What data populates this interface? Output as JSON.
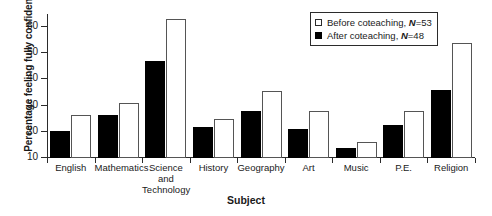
{
  "chart_data": {
    "type": "bar",
    "title": "",
    "xlabel": "Subject",
    "ylabel": "Percentage feeling fully confident",
    "ylim": [
      10,
      65
    ],
    "yticks": [
      10,
      20,
      30,
      40,
      50,
      60
    ],
    "grid": false,
    "legend_position": "top-right",
    "categories": [
      "English",
      "Mathematics",
      "Science\nand\nTechnology",
      "History",
      "Geography",
      "Art",
      "Music",
      "P.E.",
      "Religion"
    ],
    "series": [
      {
        "name": "After coteaching",
        "n": 48,
        "style": "filled-black",
        "values": [
          20.5,
          26.5,
          47,
          22,
          28,
          21,
          14,
          22.5,
          36
        ]
      },
      {
        "name": "Before coteaching",
        "n": 53,
        "style": "open-white",
        "values": [
          26.5,
          31,
          63,
          25,
          35.5,
          28,
          16,
          28,
          54
        ]
      }
    ]
  },
  "legend": {
    "entries": [
      {
        "label_prefix": "Before coteaching, ",
        "n_label": "N",
        "n_value": "=53",
        "swatch": "white-open-square"
      },
      {
        "label_prefix": "After coteaching,  ",
        "n_label": "N",
        "n_value": "=48",
        "swatch": "black-filled-square"
      }
    ]
  },
  "axes": {
    "y_title": "Percentage feeling fully confident",
    "x_title": "Subject",
    "y_tick_labels": [
      "10",
      "20",
      "30",
      "40",
      "50",
      "60"
    ]
  }
}
